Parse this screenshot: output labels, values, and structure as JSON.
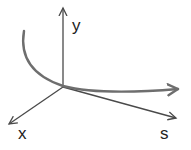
{
  "diagram": {
    "type": "3d-axes-with-curve",
    "axes": [
      {
        "name": "y",
        "label": "y",
        "direction": "up"
      },
      {
        "name": "x",
        "label": "x",
        "direction": "down-left"
      },
      {
        "name": "s",
        "label": "s",
        "direction": "down-right"
      }
    ],
    "curve": {
      "description": "curved arrow starting upper-left, passing through origin, heading right"
    },
    "colors": {
      "axis": "#4a4a4a",
      "curve": "#6e6e6e",
      "label": "#222222",
      "background": "#ffffff"
    }
  }
}
